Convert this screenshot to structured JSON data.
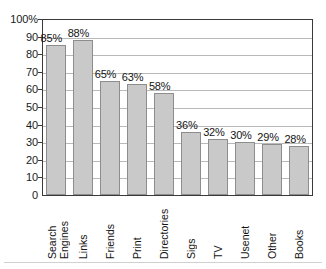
{
  "chart_data": {
    "type": "bar",
    "title": "",
    "subtitle": "",
    "xlabel": "",
    "ylabel": "",
    "ylim": [
      0,
      100
    ],
    "grid": true,
    "legend": null,
    "orientation": "vertical",
    "categories": [
      "Search Engines",
      "Links",
      "Friends",
      "Print",
      "Directories",
      "Sigs",
      "TV",
      "Usenet",
      "Other",
      "Books"
    ],
    "category_lines": [
      [
        "Search",
        "Engines"
      ],
      [
        "Links"
      ],
      [
        "Friends"
      ],
      [
        "Print"
      ],
      [
        "Directories"
      ],
      [
        "Sigs"
      ],
      [
        "TV"
      ],
      [
        "Usenet"
      ],
      [
        "Other"
      ],
      [
        "Books"
      ]
    ],
    "values": [
      85,
      88,
      65,
      63,
      58,
      36,
      32,
      30,
      29,
      28
    ],
    "data_labels": [
      "85%",
      "88%",
      "65%",
      "63%",
      "58%",
      "36%",
      "32%",
      "30%",
      "29%",
      "28%"
    ],
    "y_ticks": [
      0,
      10,
      20,
      30,
      40,
      50,
      60,
      70,
      80,
      90,
      100
    ],
    "y_tick_labels": [
      "0",
      "10",
      "20",
      "30",
      "40",
      "50",
      "60",
      "70",
      "80",
      "90",
      "100%"
    ],
    "colors": {
      "bar_fill": "#c9c9c9",
      "bar_stroke": "#8d8d8d",
      "gridline": "#b9b9b9",
      "axis": "#3a3a3a",
      "text": "#141414",
      "background": "#ffffff"
    }
  }
}
